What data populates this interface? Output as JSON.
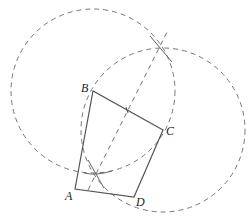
{
  "diagram": {
    "type": "geometric-construction",
    "colors": {
      "stroke": "#555555",
      "dashed": "#777777",
      "label": "#222222",
      "background": "#ffffff"
    },
    "points": {
      "A": {
        "label": "A",
        "x": 75,
        "y": 189
      },
      "B": {
        "label": "B",
        "x": 93,
        "y": 91
      },
      "C": {
        "label": "C",
        "x": 163,
        "y": 130
      },
      "D": {
        "label": "D",
        "x": 134,
        "y": 197
      }
    },
    "polygon": [
      "A",
      "B",
      "C",
      "D"
    ],
    "circles": [
      {
        "name": "circle-centered-B",
        "cx": 93,
        "cy": 91,
        "r": 82
      },
      {
        "name": "circle-centered-C",
        "cx": 163,
        "cy": 130,
        "r": 82
      }
    ],
    "intersections": {
      "top": {
        "x": 161,
        "y": 48
      },
      "bottom": {
        "x": 95,
        "y": 173
      }
    },
    "labels": {
      "A": "A",
      "B": "B",
      "C": "C",
      "D": "D"
    }
  }
}
